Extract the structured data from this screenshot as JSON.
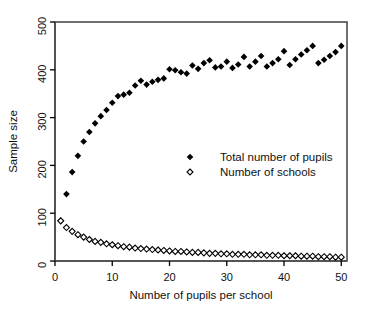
{
  "chart_data": {
    "type": "scatter",
    "title": "",
    "xlabel": "Number of pupils per school",
    "ylabel": "Sample size",
    "xlim": [
      0,
      51
    ],
    "ylim": [
      0,
      500
    ],
    "xticks": [
      0,
      10,
      20,
      30,
      40,
      50
    ],
    "yticks": [
      0,
      100,
      200,
      300,
      400,
      500
    ],
    "xticklabels": [
      "0",
      "10",
      "20",
      "30",
      "40",
      "50"
    ],
    "yticklabels": [
      "0",
      "100",
      "200",
      "300",
      "400",
      "500"
    ],
    "grid": false,
    "legend_position": "center",
    "x": [
      1,
      2,
      3,
      4,
      5,
      6,
      7,
      8,
      9,
      10,
      11,
      12,
      13,
      14,
      15,
      16,
      17,
      18,
      19,
      20,
      21,
      22,
      23,
      24,
      25,
      26,
      27,
      28,
      29,
      30,
      31,
      32,
      33,
      34,
      35,
      36,
      37,
      38,
      39,
      40,
      41,
      42,
      43,
      44,
      45,
      46,
      47,
      48,
      49,
      50
    ],
    "series": [
      {
        "name": "Total number of pupils",
        "marker": "filled-diamond",
        "color": "#000000",
        "values": [
          84,
          140,
          186,
          220,
          250,
          270,
          288,
          303,
          316,
          331,
          345,
          348,
          352,
          367,
          377,
          369,
          375,
          379,
          382,
          401,
          399,
          395,
          392,
          409,
          402,
          414,
          420,
          405,
          407,
          417,
          404,
          411,
          427,
          407,
          417,
          429,
          407,
          414,
          422,
          439,
          410,
          422,
          432,
          441,
          450,
          414,
          421,
          429,
          437,
          450
        ]
      },
      {
        "name": "Number of schools",
        "marker": "open-diamond",
        "color": "#000000",
        "values": [
          84,
          70,
          62,
          55,
          50,
          45,
          41,
          39,
          36,
          34,
          32,
          30,
          29,
          27,
          26,
          25,
          24,
          23,
          22,
          21,
          20,
          20,
          19,
          18,
          18,
          17,
          16,
          16,
          15,
          15,
          14,
          14,
          14,
          13,
          13,
          13,
          12,
          12,
          12,
          11,
          11,
          11,
          10,
          10,
          10,
          9,
          9,
          9,
          8,
          8
        ]
      }
    ]
  },
  "legend": {
    "entries": [
      {
        "label": "Total number of pupils",
        "marker": "filled-diamond-icon"
      },
      {
        "label": "Number of schools",
        "marker": "open-diamond-icon"
      }
    ]
  }
}
